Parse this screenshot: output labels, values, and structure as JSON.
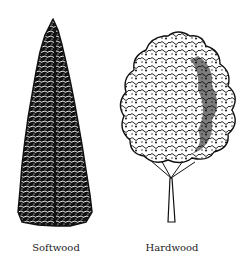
{
  "figure": {
    "trees": [
      {
        "label": "Softwood",
        "icon": "conifer-tree-icon"
      },
      {
        "label": "Hardwood",
        "icon": "deciduous-tree-icon"
      }
    ]
  },
  "colors": {
    "ink": "#111111",
    "background": "#ffffff"
  }
}
